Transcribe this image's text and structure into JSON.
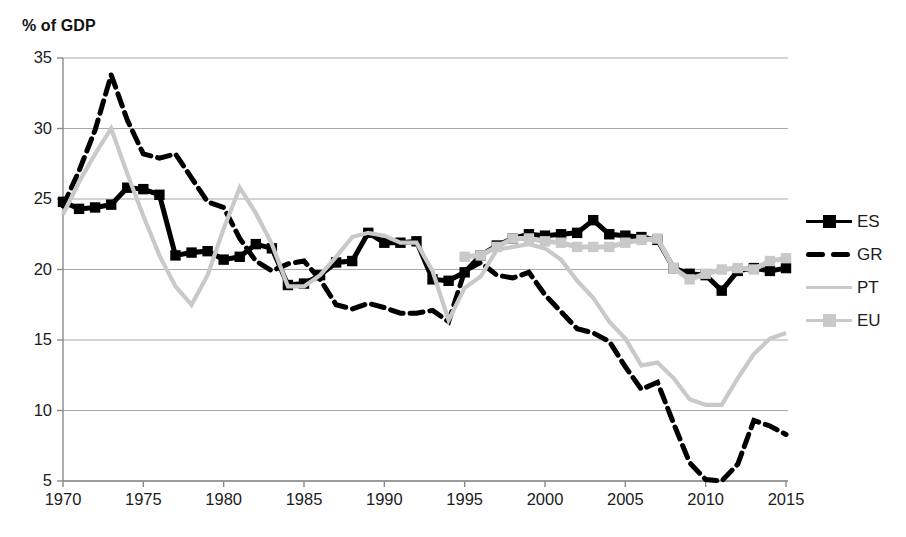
{
  "chart_data": {
    "type": "line",
    "title": "% of GDP",
    "ylabel": "% of GDP",
    "xlabel": "",
    "xlim": [
      1970,
      2015
    ],
    "ylim": [
      5,
      35
    ],
    "xticks": [
      1970,
      1975,
      1980,
      1985,
      1990,
      1995,
      2000,
      2005,
      2010,
      2015
    ],
    "yticks": [
      5,
      10,
      15,
      20,
      25,
      30,
      35
    ],
    "grid": "horizontal",
    "legend_position": "right",
    "x": [
      1970,
      1971,
      1972,
      1973,
      1974,
      1975,
      1976,
      1977,
      1978,
      1979,
      1980,
      1981,
      1982,
      1983,
      1984,
      1985,
      1986,
      1987,
      1988,
      1989,
      1990,
      1991,
      1992,
      1993,
      1994,
      1995,
      1996,
      1997,
      1998,
      1999,
      2000,
      2001,
      2002,
      2003,
      2004,
      2005,
      2006,
      2007,
      2008,
      2009,
      2010,
      2011,
      2012,
      2013,
      2014,
      2015
    ],
    "series": [
      {
        "name": "ES",
        "color": "#000000",
        "style": "solid-square-markers",
        "values": [
          24.8,
          24.3,
          24.4,
          24.6,
          25.8,
          25.7,
          25.3,
          21.0,
          21.2,
          21.3,
          20.7,
          20.9,
          21.8,
          21.5,
          18.9,
          19.0,
          19.6,
          20.5,
          20.6,
          22.6,
          21.9,
          21.9,
          22.0,
          19.3,
          19.2,
          19.8,
          21.0,
          21.7,
          22.2,
          22.5,
          22.4,
          22.5,
          22.6,
          23.5,
          22.5,
          22.4,
          22.3,
          22.1,
          20.1,
          19.7,
          19.6,
          18.5,
          19.9,
          20.1,
          19.9,
          20.1
        ]
      },
      {
        "name": "GR",
        "color": "#000000",
        "style": "dashed",
        "values": [
          24.5,
          27.0,
          29.9,
          33.8,
          30.6,
          28.2,
          27.9,
          28.2,
          26.5,
          24.8,
          24.4,
          22.2,
          20.6,
          19.9,
          20.4,
          20.6,
          19.3,
          17.5,
          17.2,
          17.6,
          17.3,
          16.9,
          16.9,
          17.1,
          16.3,
          19.9,
          20.5,
          19.6,
          19.4,
          19.8,
          18.2,
          17.0,
          15.8,
          15.5,
          14.9,
          13.1,
          11.5,
          12.0,
          9.1,
          6.3,
          5.1,
          5.0,
          6.2,
          9.3,
          8.9,
          8.3
        ]
      },
      {
        "name": "PT",
        "color": "#c9c9c9",
        "style": "solid",
        "values": [
          23.9,
          26.2,
          28.2,
          30.0,
          26.8,
          23.8,
          21.0,
          18.8,
          17.5,
          19.6,
          22.9,
          25.8,
          24.0,
          21.8,
          18.8,
          18.8,
          19.6,
          20.9,
          22.3,
          22.6,
          22.4,
          21.9,
          21.9,
          19.9,
          16.4,
          18.7,
          19.5,
          21.4,
          21.6,
          21.8,
          21.5,
          20.7,
          19.2,
          18.0,
          16.3,
          15.1,
          13.2,
          13.4,
          12.3,
          10.8,
          10.4,
          10.4,
          12.3,
          14.0,
          15.1,
          15.5
        ]
      },
      {
        "name": "EU",
        "color": "#c9c9c9",
        "style": "solid-square-markers",
        "values": [
          null,
          null,
          null,
          null,
          null,
          null,
          null,
          null,
          null,
          null,
          null,
          null,
          null,
          null,
          null,
          null,
          null,
          null,
          null,
          null,
          null,
          null,
          null,
          null,
          null,
          20.9,
          21.0,
          21.6,
          22.2,
          22.2,
          22.0,
          21.9,
          21.6,
          21.6,
          21.6,
          21.9,
          22.1,
          22.2,
          20.1,
          19.3,
          19.7,
          20.0,
          20.1,
          20.0,
          20.6,
          20.8
        ]
      }
    ]
  },
  "legend": {
    "items": [
      {
        "label": "ES",
        "key": "solid-square-markers",
        "color": "#000000"
      },
      {
        "label": "GR",
        "key": "dashed",
        "color": "#000000"
      },
      {
        "label": "PT",
        "key": "solid",
        "color": "#c9c9c9"
      },
      {
        "label": "EU",
        "key": "solid-square-markers",
        "color": "#c9c9c9"
      }
    ]
  },
  "axes": {
    "y_label_text": "% of GDP",
    "ytick_labels": [
      "35",
      "30",
      "25",
      "20",
      "15",
      "10",
      "5"
    ],
    "xtick_labels": [
      "1970",
      "1975",
      "1980",
      "1985",
      "1990",
      "1995",
      "2000",
      "2005",
      "2010",
      "2015"
    ]
  },
  "colors": {
    "dark_series": "#000000",
    "light_series": "#c9c9c9",
    "gridline": "#a9a9a9",
    "axis": "#8a8a8a",
    "text": "#1c1c1c"
  }
}
